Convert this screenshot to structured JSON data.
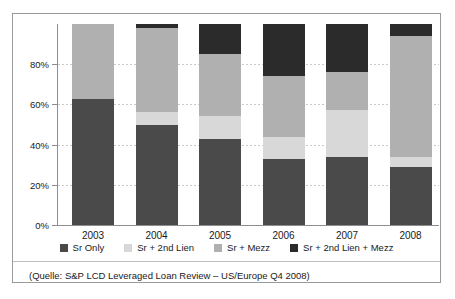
{
  "chart_data": {
    "type": "bar",
    "stacked": true,
    "title": "",
    "subtitle": "",
    "xlabel": "",
    "ylabel": "",
    "categories": [
      "2003",
      "2004",
      "2005",
      "2006",
      "2007",
      "2008"
    ],
    "series": [
      {
        "name": "Sr Only",
        "color": "#4a4a4a",
        "values": [
          62.5,
          50.0,
          43.0,
          33.0,
          34.0,
          29.0
        ]
      },
      {
        "name": "Sr + 2nd Lien",
        "color": "#d8d8d8",
        "values": [
          0.0,
          6.0,
          11.0,
          11.0,
          23.0,
          5.0
        ]
      },
      {
        "name": "Sr + Mezz",
        "color": "#b0b0b0",
        "values": [
          37.5,
          42.0,
          31.0,
          30.0,
          19.0,
          60.0
        ]
      },
      {
        "name": "Sr + 2nd Lien + Mezz",
        "color": "#2b2b2b",
        "values": [
          0.0,
          2.0,
          15.0,
          26.0,
          24.0,
          6.0
        ]
      }
    ],
    "ylim": [
      0,
      100
    ],
    "yticks": [
      0,
      20,
      40,
      60,
      80
    ],
    "ytick_labels": [
      "0%",
      "20%",
      "40%",
      "60%",
      "80%"
    ],
    "grid": true,
    "legend_position": "bottom"
  },
  "legend": {
    "items": [
      {
        "label": "Sr Only",
        "color": "#4a4a4a"
      },
      {
        "label": "Sr + 2nd Lien",
        "color": "#d8d8d8"
      },
      {
        "label": "Sr + Mezz",
        "color": "#b0b0b0"
      },
      {
        "label": "Sr + 2nd Lien + Mezz",
        "color": "#2b2b2b"
      }
    ]
  },
  "source": {
    "text": "(Quelle: S&P LCD Leveraged Loan Review – US/Europe Q4 2008)"
  }
}
